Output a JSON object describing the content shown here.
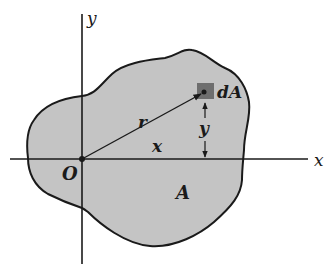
{
  "figure": {
    "type": "area-moment-of-inertia-diagram",
    "colors": {
      "background": "#ffffff",
      "region_fill": "#c4c4c4",
      "element_fill": "#6e6e6e",
      "stroke": "#1a1a1a"
    },
    "axes": {
      "x_label": "x",
      "y_label": "y",
      "origin_label": "O"
    },
    "region_label": "A",
    "element_label": "dA",
    "vector_label": "r",
    "horizontal_distance_label": "x",
    "vertical_distance_label": "y"
  }
}
